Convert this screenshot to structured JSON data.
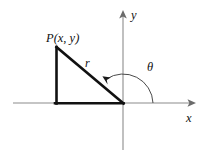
{
  "figure": {
    "background_color": "#ffffff",
    "axis_color": "#8c8c8c",
    "triangle_color": "#111111",
    "arc_color": "#4a4a4a",
    "labels": {
      "point": "P(x, y)",
      "radius": "r",
      "angle": "θ",
      "y_axis": "y",
      "x_axis": "x"
    },
    "geometry": {
      "origin": {
        "x": 123,
        "y": 103
      },
      "point_p": {
        "x": 56,
        "y": 47
      },
      "foot": {
        "x": 56,
        "y": 103
      },
      "y_axis_top": {
        "x": 123,
        "y": 11
      },
      "y_axis_bottom": {
        "x": 123,
        "y": 150
      },
      "x_axis_left": {
        "x": 13,
        "y": 103
      },
      "x_axis_right": {
        "x": 195,
        "y": 103
      },
      "arc_radius": 30
    }
  }
}
